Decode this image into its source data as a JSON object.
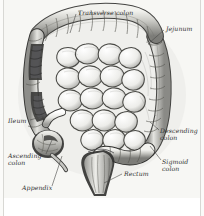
{
  "figure": {
    "type": "anatomical-illustration",
    "style": "grayscale engraving",
    "background_color": "#f7f7f4",
    "ink_color": "#2f2f2f",
    "border_color": "#d8d8d4"
  },
  "labels": [
    {
      "id": "transverse-colon",
      "text": "Transverse colon",
      "lines": [
        "Transverse colon"
      ],
      "x": 78,
      "y": 9,
      "align": "left"
    },
    {
      "id": "jejunum",
      "text": "Jejunum",
      "lines": [
        "Jejunum"
      ],
      "x": 166,
      "y": 25,
      "align": "left"
    },
    {
      "id": "descending-colon",
      "text": "Descending colon",
      "lines": [
        "Descending",
        "colon"
      ],
      "x": 160,
      "y": 127,
      "align": "left"
    },
    {
      "id": "sigmoid-colon",
      "text": "Sigmoid colon",
      "lines": [
        "Sigmoid",
        "colon"
      ],
      "x": 162,
      "y": 158,
      "align": "left"
    },
    {
      "id": "rectum",
      "text": "Rectum",
      "lines": [
        "Rectum"
      ],
      "x": 124,
      "y": 170,
      "align": "left"
    },
    {
      "id": "ileum",
      "text": "Ileum",
      "lines": [
        "Ileum"
      ],
      "x": 8,
      "y": 117,
      "align": "left"
    },
    {
      "id": "ascending-colon",
      "text": "Ascending colon",
      "lines": [
        "Ascending",
        "colon"
      ],
      "x": 8,
      "y": 152,
      "align": "left"
    },
    {
      "id": "appendix",
      "text": "Appendix",
      "lines": [
        "Appendix"
      ],
      "x": 22,
      "y": 184,
      "align": "left"
    }
  ],
  "leaders": [
    {
      "id": "leader-transverse-colon",
      "x1": 76,
      "y1": 14,
      "x2": 70,
      "y2": 33
    },
    {
      "id": "leader-jejunum",
      "x1": 164,
      "y1": 30,
      "x2": 148,
      "y2": 44
    },
    {
      "id": "leader-descending-colon",
      "x1": 159,
      "y1": 130,
      "x2": 150,
      "y2": 122
    },
    {
      "id": "leader-sigmoid-colon",
      "x1": 161,
      "y1": 160,
      "x2": 150,
      "y2": 146
    },
    {
      "id": "leader-rectum",
      "x1": 122,
      "y1": 174,
      "x2": 104,
      "y2": 183
    },
    {
      "id": "leader-ileum",
      "x1": 30,
      "y1": 120,
      "x2": 44,
      "y2": 116
    },
    {
      "id": "leader-ascending-colon",
      "x1": 46,
      "y1": 154,
      "x2": 52,
      "y2": 140
    },
    {
      "id": "leader-appendix",
      "x1": 52,
      "y1": 186,
      "x2": 62,
      "y2": 156
    }
  ]
}
